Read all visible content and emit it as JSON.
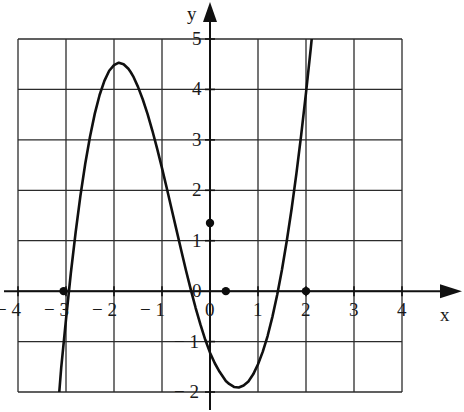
{
  "chart_data": {
    "type": "line",
    "title": "",
    "xlabel": "x",
    "ylabel": "y",
    "xlim": [
      -4,
      4
    ],
    "ylim": [
      -2,
      5
    ],
    "xticks": [
      -4,
      -3,
      -2,
      -1,
      0,
      1,
      2,
      3,
      4
    ],
    "xtick_labels": [
      "− 4",
      "− 3",
      "− 2",
      "− 1",
      "0",
      "1",
      "2",
      "3",
      "4"
    ],
    "yticks": [
      -2,
      -1,
      0,
      1,
      2,
      3,
      4,
      5
    ],
    "ytick_labels": [
      "− 2",
      "− 1",
      "0",
      "1",
      "2",
      "3",
      "4",
      "5"
    ],
    "grid": true,
    "grid_step_x": 1,
    "grid_step_y": 1,
    "axis_arrows": [
      "x-positive",
      "y-positive"
    ],
    "series": [
      {
        "name": "cubic-curve",
        "color": "#101010",
        "line_width": 2.6,
        "x": [
          -3.14,
          -3.1,
          -3.05,
          -3.0,
          -2.9,
          -2.8,
          -2.7,
          -2.6,
          -2.5,
          -2.4,
          -2.3,
          -2.2,
          -2.1,
          -2.0,
          -1.9,
          -1.8,
          -1.7,
          -1.65,
          -1.6,
          -1.5,
          -1.4,
          -1.3,
          -1.2,
          -1.1,
          -1.0,
          -0.9,
          -0.8,
          -0.7,
          -0.6,
          -0.5,
          -0.4,
          -0.3,
          -0.2,
          -0.1,
          0.0,
          0.1,
          0.2,
          0.33,
          0.4,
          0.5,
          0.6,
          0.7,
          0.8,
          0.9,
          1.0,
          1.1,
          1.2,
          1.3,
          1.4,
          1.5,
          1.6,
          1.7,
          1.8,
          1.9,
          2.0,
          2.1,
          2.2,
          2.3,
          2.4,
          2.5,
          2.6,
          2.7,
          2.8,
          2.9,
          3.0
        ],
        "y": [
          -2.0,
          -1.52,
          -1.04,
          -0.56,
          0.35,
          1.16,
          1.89,
          2.52,
          3.06,
          3.52,
          3.89,
          4.17,
          4.37,
          4.48,
          4.53,
          4.5,
          4.41,
          4.34,
          4.26,
          4.05,
          3.8,
          3.51,
          3.18,
          2.82,
          2.44,
          2.04,
          1.63,
          1.22,
          0.81,
          0.41,
          0.03,
          -0.33,
          -0.66,
          -0.96,
          -1.22,
          -1.43,
          -1.6,
          -1.78,
          -1.84,
          -1.9,
          -1.91,
          -1.87,
          -1.79,
          -1.65,
          -1.45,
          -1.2,
          -0.89,
          -0.51,
          -0.07,
          0.43,
          1.0,
          1.63,
          2.33,
          3.1,
          3.93,
          4.82,
          5.78,
          6.8,
          7.88,
          9.03,
          10.24,
          11.51,
          12.84,
          14.24,
          15.7
        ],
        "y_display_note": "rendered y values are the plotted curve ordinates; curve is clipped to the plot window [-2, 5]"
      }
    ],
    "marked_points": [
      {
        "name": "root-left",
        "x": -3.05,
        "y": 0,
        "label": ""
      },
      {
        "name": "y-intercept",
        "x": 0,
        "y": 1.35,
        "label": ""
      },
      {
        "name": "root-middle",
        "x": 0.33,
        "y": 0,
        "label": ""
      },
      {
        "name": "root-right",
        "x": 2.0,
        "y": 0,
        "label": ""
      }
    ],
    "features": {
      "local_maximum": {
        "x": -1.65,
        "y": 4.25
      },
      "local_minimum": {
        "x": 1.32,
        "y": -1.0
      },
      "roots": [
        -3.05,
        0.33,
        2.0
      ],
      "y_intercept": 1.35,
      "curve_right_endpoint": {
        "x": 3.0,
        "y": 5.0
      },
      "curve_left_endpoint": {
        "x": -3.14,
        "y": -2.0
      }
    }
  }
}
